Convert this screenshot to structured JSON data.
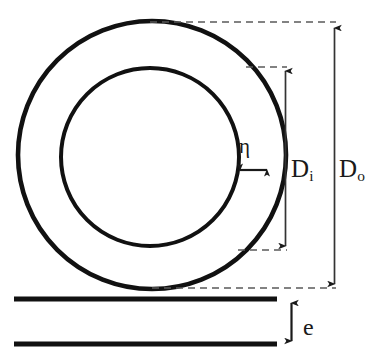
{
  "figure": {
    "kind": "engineering-dimension-diagram",
    "background_color": "#ffffff",
    "stroke_color": "#111111",
    "dimension_line_color": "#333333"
  },
  "labels": {
    "wall_thickness": {
      "symbol": "η",
      "name": "eta",
      "meaning": "ring wall thickness"
    },
    "inner_diameter": {
      "base": "D",
      "subscript": "i",
      "meaning": "inner diameter"
    },
    "outer_diameter": {
      "base": "D",
      "subscript": "o",
      "meaning": "outer diameter"
    },
    "height": {
      "symbol": "e",
      "meaning": "ring height / edge thickness"
    }
  },
  "geometry": {
    "outer_circle": {
      "cx": 152,
      "cy": 155,
      "r": 134,
      "stroke_width": 4.6
    },
    "inner_circle": {
      "cx": 150,
      "cy": 157,
      "r": 89,
      "stroke_width": 4.0
    },
    "eta_arrow": {
      "x1": 237,
      "x2": 270,
      "y": 170
    },
    "inner_diameter_line": {
      "x": 285,
      "y1": 67,
      "y2": 250
    },
    "outer_diameter_line": {
      "x": 334,
      "y1": 24,
      "y2": 288
    },
    "side_view_top_bar": {
      "x1": 14,
      "x2": 277,
      "y": 299,
      "thickness": 5
    },
    "side_view_bottom_bar": {
      "x1": 14,
      "x2": 277,
      "y": 344,
      "thickness": 5
    },
    "height_arrow": {
      "x": 291,
      "y1": 300,
      "y2": 344
    }
  }
}
